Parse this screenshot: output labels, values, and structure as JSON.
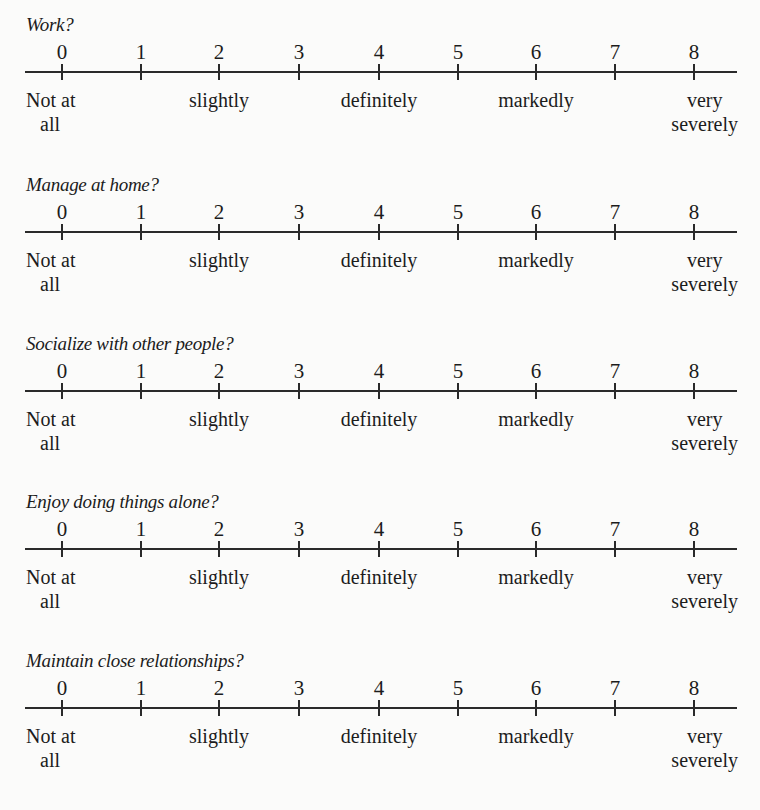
{
  "scale_points": [
    "0",
    "1",
    "2",
    "3",
    "4",
    "5",
    "6",
    "7",
    "8"
  ],
  "anchors": {
    "a0": {
      "line1": "Not at",
      "line2": "all"
    },
    "a2": {
      "line1": "slightly"
    },
    "a4": {
      "line1": "definitely"
    },
    "a6": {
      "line1": "markedly"
    },
    "a8": {
      "line1": "very",
      "line2": "severely"
    }
  },
  "questions": [
    {
      "label": "Work?"
    },
    {
      "label": "Manage at home?"
    },
    {
      "label": "Socialize with other people?"
    },
    {
      "label": "Enjoy doing things alone?"
    },
    {
      "label": "Maintain close relationships?"
    }
  ]
}
